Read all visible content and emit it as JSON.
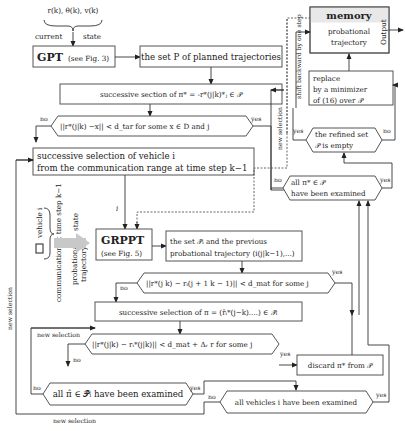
{
  "diagram": {
    "state_input": {
      "variables": "r(k), θ(k), v(k)",
      "label_left": "current",
      "label_right": "state"
    },
    "gpt_box": {
      "title": "GPT",
      "ref": "(see Fig. 3)"
    },
    "planned_set_box": {
      "text": "the set P of planned trajectories"
    },
    "memory_box": {
      "title": "memory",
      "line1": "probational",
      "line2": "trajectory",
      "fill": "#e8e8e8"
    },
    "output_label": "Output",
    "replace_box": {
      "line1": "replace",
      "line2": "by a minimizer",
      "line3": "of (16) over 𝒫"
    },
    "shift_label": "shift backward by one step",
    "successive_pi_star_box": {
      "text": "successive section of π* = -r*(j|k)*ⱼ ∈ 𝒫"
    },
    "decision_dtar": {
      "text": "||r*(j|k) −x|| < d_tar  for some  x ∈ D and j",
      "no": "no",
      "yes": "yes"
    },
    "refined_set_decision": {
      "line1": "the refined set",
      "line2": "𝒫 is empty",
      "yes": "yes",
      "no": "no"
    },
    "new_selection_vertical": "new selection",
    "vehicle_selection_box": {
      "line1": "successive selection of vehicle i",
      "line2": "from the communication range at time step k−1"
    },
    "all_pi_star_decision": {
      "line1": "all π* ∈ 𝒫",
      "line2": "have been examined",
      "no": "no",
      "yes": "yes"
    },
    "arrow_i_label": "i",
    "communication_side": {
      "vehicle_label": "vehicle i",
      "communication": "communication at time step k−1",
      "state": "state",
      "probational1": "probational",
      "probational2": "trajectory",
      "arrow_color": "#c8c8c8"
    },
    "grppt_box": {
      "title": "GRPPT",
      "ref": "(see Fig. 5)"
    },
    "set_pi_box": {
      "line1": "the set 𝒫̃ᵢ and the previous",
      "line2": "probational trajectory (i(j|k−1),...)"
    },
    "decision_dmat1": {
      "text": "||r*(j k) − rᵢ(j + 1 k − 1)|| < d_mat  for some  j",
      "no": "no",
      "yes": "yes"
    },
    "successive_pi_box": {
      "text": "successive selection of π = (r̂ᵢ*(j−k)....) ∈ 𝒫̃ᵢ"
    },
    "new_selection_inner": "new selection",
    "decision_dmat2": {
      "text": "||r*(j|k) − rᵢ*(j|k)|| < d_mat + Δᵣ r for some  j",
      "no": "no",
      "yes": "yes"
    },
    "discard_box": {
      "text": "discard π* from 𝒫"
    },
    "all_pi_hat_decision": {
      "text": "all π̂ ∈ 𝒫̃ᵢ have been examined",
      "no": "no",
      "yes": "yes"
    },
    "all_vehicles_decision": {
      "text": "all vehicles i have been examined",
      "no": "no",
      "yes": "yes"
    },
    "new_selection_bottom": "new selection",
    "new_selection_left": "new selection"
  }
}
